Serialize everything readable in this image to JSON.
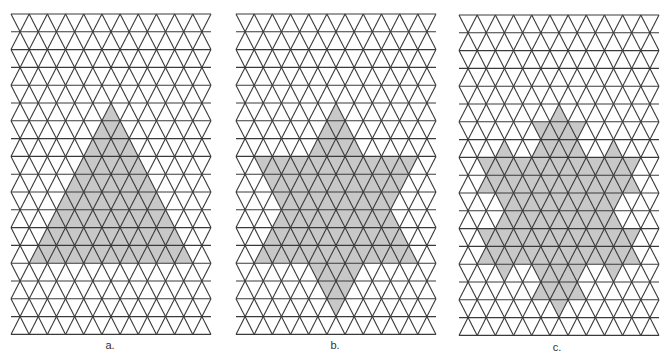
{
  "figure": {
    "grid": {
      "columns": 11,
      "rows": 18,
      "cell_width": 18.18,
      "row_height": 17.8,
      "line_color": "#3a3a3a",
      "fill_color": "#c8c8c8"
    },
    "panels": [
      {
        "id": "a",
        "label": "a.",
        "origin": [
          11,
          14
        ],
        "label_pos": [
          110,
          349
        ],
        "shape": "triangle",
        "koch_iterations": 0,
        "description": "Triangle of side 9"
      },
      {
        "id": "b",
        "label": "b.",
        "origin": [
          236,
          14
        ],
        "label_pos": [
          335,
          349
        ],
        "shape": "hexagram",
        "koch_iterations": 1,
        "description": "First Koch iteration (hexagram)"
      },
      {
        "id": "c",
        "label": "c.",
        "origin": [
          459,
          15
        ],
        "label_pos": [
          557,
          351
        ],
        "shape": "koch",
        "koch_iterations": 2,
        "description": "Second Koch iteration"
      }
    ],
    "base_triangle": {
      "apex": [
        5.5,
        5
      ],
      "base_row": 14,
      "side": 9
    }
  }
}
